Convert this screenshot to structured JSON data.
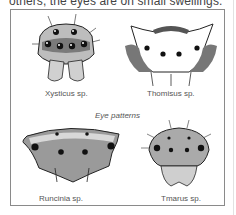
{
  "intro_text": "others, the eyes are on small swellings.",
  "figure": {
    "title": "Eye patterns",
    "panels": [
      {
        "id": "xysticus",
        "caption": "Xysticus sp."
      },
      {
        "id": "thomisus",
        "caption": "Thomisus sp."
      },
      {
        "id": "runcinia",
        "caption": "Runcinia sp."
      },
      {
        "id": "tmarus",
        "caption": "Tmarus sp."
      }
    ]
  }
}
